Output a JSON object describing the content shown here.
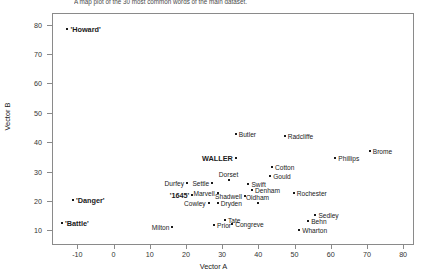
{
  "caption": "A map plot of the 30 most common words of the main dataset.",
  "axes": {
    "xlabel": "Vector A",
    "ylabel": "Vector B",
    "xticks": [
      -10,
      0,
      10,
      20,
      30,
      40,
      50,
      60,
      70,
      80
    ],
    "yticks": [
      10,
      20,
      30,
      40,
      50,
      60,
      70,
      80
    ],
    "xlim": [
      -17,
      83
    ],
    "ylim": [
      5,
      84
    ]
  },
  "chart_data": {
    "type": "scatter",
    "title": "A map plot of the 30 most common words of the main dataset.",
    "xlabel": "Vector A",
    "ylabel": "Vector B",
    "xlim": [
      -17,
      83
    ],
    "ylim": [
      5,
      84
    ],
    "grid": false,
    "legend": null,
    "points": [
      {
        "label": "'Howard'",
        "x": -13.0,
        "y": 79.0,
        "bold": true,
        "side": "right"
      },
      {
        "label": "'Danger'",
        "x": -11.5,
        "y": 20.5,
        "bold": true,
        "side": "right"
      },
      {
        "label": "'Battle'",
        "x": -14.5,
        "y": 13.0,
        "bold": true,
        "side": "right"
      },
      {
        "label": "Butler",
        "x": 33.5,
        "y": 43.0,
        "bold": false,
        "side": "right"
      },
      {
        "label": "Radcliffe",
        "x": 47.0,
        "y": 42.5,
        "bold": false,
        "side": "right"
      },
      {
        "label": "Phillips",
        "x": 61.0,
        "y": 35.0,
        "bold": false,
        "side": "right"
      },
      {
        "label": "Brome",
        "x": 70.5,
        "y": 37.5,
        "bold": false,
        "side": "right"
      },
      {
        "label": "WALLER",
        "x": 33.5,
        "y": 35.0,
        "bold": true,
        "side": "left"
      },
      {
        "label": "Cotton",
        "x": 43.5,
        "y": 32.0,
        "bold": false,
        "side": "right"
      },
      {
        "label": "Gould",
        "x": 43.0,
        "y": 29.0,
        "bold": false,
        "side": "right"
      },
      {
        "label": "Durfey",
        "x": 20.0,
        "y": 26.5,
        "bold": false,
        "side": "left"
      },
      {
        "label": "Settle",
        "x": 27.0,
        "y": 26.5,
        "bold": false,
        "side": "left"
      },
      {
        "label": "Dorset",
        "x": 31.5,
        "y": 27.5,
        "bold": false,
        "side": "center"
      },
      {
        "label": "Swift",
        "x": 37.0,
        "y": 26.0,
        "bold": false,
        "side": "right"
      },
      {
        "label": "Denham",
        "x": 38.0,
        "y": 24.0,
        "bold": false,
        "side": "right"
      },
      {
        "label": "'1645'",
        "x": 21.5,
        "y": 22.5,
        "bold": true,
        "side": "left"
      },
      {
        "label": "Marvell",
        "x": 28.5,
        "y": 23.0,
        "bold": false,
        "side": "left"
      },
      {
        "label": "Shadwell",
        "x": 36.0,
        "y": 22.0,
        "bold": false,
        "side": "left"
      },
      {
        "label": "Rochester",
        "x": 49.5,
        "y": 23.0,
        "bold": false,
        "side": "right"
      },
      {
        "label": "Cowley",
        "x": 26.0,
        "y": 19.5,
        "bold": false,
        "side": "left"
      },
      {
        "label": "Dryden",
        "x": 28.5,
        "y": 19.5,
        "bold": false,
        "side": "right"
      },
      {
        "label": "Oldham",
        "x": 39.5,
        "y": 19.5,
        "bold": false,
        "side": "center"
      },
      {
        "label": "Sedley",
        "x": 55.5,
        "y": 15.5,
        "bold": false,
        "side": "right"
      },
      {
        "label": "Behn",
        "x": 53.5,
        "y": 13.5,
        "bold": false,
        "side": "right"
      },
      {
        "label": "Tate",
        "x": 30.5,
        "y": 14.0,
        "bold": false,
        "side": "right"
      },
      {
        "label": "Congreve",
        "x": 32.5,
        "y": 12.5,
        "bold": false,
        "side": "right"
      },
      {
        "label": "Prior",
        "x": 27.5,
        "y": 12.0,
        "bold": false,
        "side": "right"
      },
      {
        "label": "Milton",
        "x": 16.0,
        "y": 11.5,
        "bold": false,
        "side": "left"
      },
      {
        "label": "Wharton",
        "x": 51.0,
        "y": 10.5,
        "bold": false,
        "side": "right"
      }
    ]
  }
}
